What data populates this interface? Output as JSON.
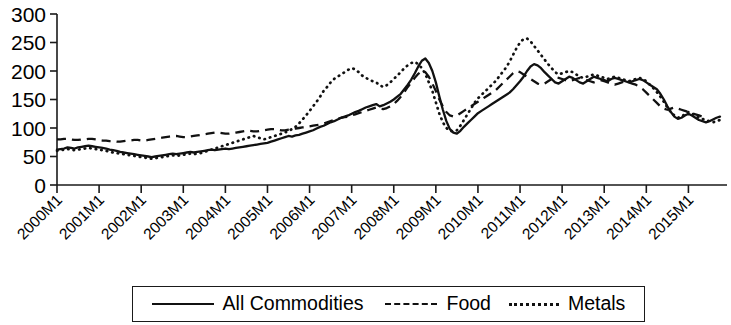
{
  "chart_data": {
    "type": "line",
    "title": "",
    "xlabel": "",
    "ylabel": "",
    "ylim": [
      0,
      300
    ],
    "ytick_labels": [
      "300",
      "250",
      "200",
      "150",
      "100",
      "50",
      "0"
    ],
    "ytick_values": [
      300,
      250,
      200,
      150,
      100,
      50,
      0
    ],
    "grid": false,
    "legend_position": "bottom",
    "x_tick_labels": [
      "2000M1",
      "2001M1",
      "2002M1",
      "2003M1",
      "2004M1",
      "2005M1",
      "2006M1",
      "2007M1",
      "2008M1",
      "2009M1",
      "2010M1",
      "2011M1",
      "2012M1",
      "2013M1",
      "2014M1",
      "2015M1"
    ],
    "x_tick_indices": [
      0,
      12,
      24,
      36,
      48,
      60,
      72,
      84,
      96,
      108,
      120,
      132,
      144,
      156,
      168,
      180
    ],
    "x_label_rotation_deg": 45,
    "n_points": 192,
    "series": [
      {
        "name": "All Commodities",
        "style": "solid",
        "color": "#111111",
        "values": [
          62,
          63,
          64,
          66,
          65,
          64,
          66,
          67,
          68,
          69,
          68,
          67,
          66,
          65,
          64,
          62,
          61,
          60,
          58,
          57,
          56,
          55,
          54,
          53,
          52,
          51,
          50,
          49,
          50,
          51,
          52,
          53,
          54,
          55,
          54,
          55,
          56,
          57,
          58,
          57,
          58,
          59,
          60,
          61,
          62,
          61,
          62,
          63,
          64,
          63,
          64,
          65,
          66,
          67,
          68,
          69,
          70,
          71,
          72,
          73,
          74,
          76,
          78,
          80,
          82,
          84,
          86,
          85,
          87,
          88,
          90,
          92,
          94,
          96,
          99,
          102,
          104,
          107,
          110,
          112,
          115,
          118,
          120,
          122,
          125,
          128,
          130,
          133,
          136,
          138,
          140,
          142,
          138,
          140,
          143,
          146,
          150,
          155,
          160,
          168,
          176,
          185,
          196,
          208,
          218,
          222,
          214,
          200,
          180,
          155,
          132,
          112,
          98,
          92,
          90,
          95,
          102,
          108,
          114,
          120,
          126,
          130,
          134,
          138,
          142,
          146,
          150,
          154,
          158,
          162,
          168,
          175,
          182,
          190,
          200,
          208,
          212,
          210,
          205,
          198,
          192,
          186,
          180,
          178,
          182,
          186,
          190,
          188,
          184,
          180,
          178,
          182,
          186,
          190,
          188,
          186,
          184,
          182,
          186,
          188,
          186,
          184,
          182,
          180,
          182,
          184,
          186,
          184,
          180,
          176,
          172,
          168,
          160,
          150,
          138,
          128,
          120,
          116,
          118,
          122,
          125,
          122,
          118,
          114,
          112,
          110,
          112,
          115,
          118,
          120
        ]
      },
      {
        "name": "Food",
        "style": "dashed",
        "color": "#111111",
        "values": [
          80,
          80,
          81,
          81,
          80,
          79,
          79,
          80,
          80,
          81,
          81,
          80,
          79,
          78,
          78,
          77,
          77,
          76,
          76,
          77,
          78,
          78,
          79,
          79,
          78,
          78,
          79,
          80,
          81,
          82,
          83,
          84,
          85,
          86,
          86,
          85,
          84,
          84,
          85,
          86,
          87,
          88,
          89,
          90,
          91,
          92,
          92,
          91,
          90,
          90,
          91,
          92,
          93,
          94,
          95,
          95,
          94,
          94,
          95,
          96,
          97,
          98,
          98,
          97,
          96,
          96,
          97,
          98,
          99,
          100,
          101,
          102,
          103,
          104,
          105,
          106,
          108,
          110,
          112,
          114,
          116,
          118,
          119,
          120,
          122,
          124,
          126,
          128,
          130,
          132,
          134,
          136,
          134,
          133,
          135,
          138,
          142,
          148,
          155,
          163,
          172,
          180,
          188,
          195,
          200,
          198,
          190,
          178,
          165,
          150,
          138,
          128,
          122,
          120,
          122,
          126,
          130,
          134,
          138,
          142,
          146,
          150,
          154,
          158,
          162,
          166,
          172,
          178,
          184,
          190,
          196,
          200,
          198,
          194,
          190,
          186,
          182,
          178,
          176,
          178,
          182,
          186,
          190,
          188,
          186,
          184,
          182,
          184,
          186,
          188,
          186,
          184,
          182,
          180,
          182,
          184,
          182,
          180,
          178,
          176,
          178,
          180,
          182,
          180,
          178,
          176,
          172,
          168,
          162,
          156,
          150,
          144,
          138,
          134,
          132,
          134,
          136,
          134,
          132,
          130,
          128,
          126,
          124,
          122,
          120,
          118
        ]
      },
      {
        "name": "Metals",
        "style": "dotted",
        "color": "#111111",
        "values": [
          60,
          61,
          62,
          63,
          62,
          61,
          62,
          63,
          64,
          65,
          64,
          63,
          62,
          61,
          60,
          58,
          57,
          56,
          55,
          54,
          53,
          52,
          51,
          50,
          49,
          48,
          47,
          46,
          47,
          48,
          49,
          50,
          51,
          52,
          51,
          52,
          53,
          54,
          55,
          54,
          55,
          56,
          58,
          60,
          62,
          64,
          66,
          68,
          70,
          72,
          74,
          76,
          78,
          80,
          82,
          84,
          86,
          84,
          82,
          80,
          82,
          84,
          86,
          88,
          90,
          92,
          95,
          98,
          102,
          108,
          115,
          122,
          130,
          138,
          146,
          155,
          165,
          172,
          180,
          186,
          190,
          194,
          198,
          202,
          205,
          203,
          198,
          192,
          188,
          185,
          182,
          180,
          175,
          172,
          175,
          180,
          186,
          192,
          198,
          205,
          210,
          214,
          216,
          212,
          205,
          195,
          180,
          165,
          145,
          125,
          110,
          100,
          95,
          94,
          96,
          104,
          114,
          124,
          134,
          144,
          152,
          158,
          164,
          170,
          176,
          182,
          190,
          198,
          206,
          216,
          228,
          240,
          250,
          256,
          257,
          252,
          244,
          236,
          228,
          220,
          212,
          205,
          198,
          194,
          196,
          198,
          200,
          198,
          194,
          190,
          188,
          190,
          192,
          194,
          192,
          190,
          188,
          186,
          188,
          190,
          188,
          186,
          184,
          182,
          184,
          186,
          188,
          186,
          182,
          176,
          170,
          163,
          155,
          146,
          136,
          128,
          122,
          118,
          120,
          124,
          128,
          125,
          122,
          118,
          116,
          114,
          112,
          110,
          112,
          114
        ]
      }
    ]
  },
  "legend": {
    "items": [
      {
        "label": "All Commodities",
        "style": "solid"
      },
      {
        "label": "Food",
        "style": "dashed"
      },
      {
        "label": "Metals",
        "style": "dotted"
      }
    ]
  }
}
